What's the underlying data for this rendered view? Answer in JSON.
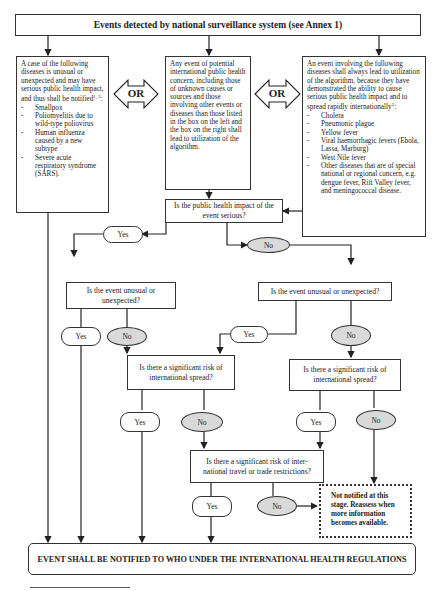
{
  "title": "Events detected by national surveillance system (see Annex 1)",
  "sources": {
    "left": {
      "intro": "A case of the following diseases is unusual or unexpected and may have serious public health impact, and thus shall be notified",
      "intro_sup": "1, 2",
      "items": [
        "Smallpox",
        "Poliomyelitis due to wild-type poliovirus",
        "Human influenza caused by a new subtype",
        "Severe acute respiratory syndrome (SARS)."
      ]
    },
    "middle": {
      "text": "Any event of potential international public health concern, including those of unknown causes or sources and those involving other events or diseases than those listed in the box on the left and the box on the right shall lead to utilization of the algorithm."
    },
    "right": {
      "intro": "An event involving the following diseases shall always lead to utilization of the algorithm, because they have demonstrated the ability to cause serious public health impact and to spread rapidly internationally",
      "intro_sup": "2",
      "items": [
        "Cholera",
        "Pneumonic plague",
        "Yellow fever",
        "Viral haemorrhagic fevers (Ebola, Lassa, Marburg)",
        "West Nile fever",
        "Other diseases that are of special national or regional concern, e.g. dengue fever, Rift Valley fever, and meningococcal disease."
      ]
    }
  },
  "connectors": {
    "or_left": "OR",
    "or_right": "OR"
  },
  "questions": {
    "q1": "Is the public health impact of the event serious?",
    "q2_left": "Is the event unusual or unexpected?",
    "q2_right": "Is the event unusual or unexpected?",
    "q3_left": "Is there a significant risk of international spread?",
    "q3_right": "Is there a significant risk of international spread?",
    "q4": "Is there a significant risk of inter-national travel or trade restrictions?"
  },
  "answers": {
    "yes": "Yes",
    "no": "No"
  },
  "not_notified": "Not notified at this stage. Reassess when more information becomes available.",
  "outcome": "EVENT SHALL BE NOTIFIED TO WHO UNDER THE INTERNATIONAL HEALTH REGULATIONS"
}
